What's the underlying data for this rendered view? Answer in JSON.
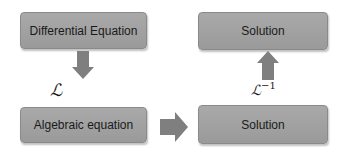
{
  "nodes": {
    "differential": {
      "label": "Differential Equation"
    },
    "solution_top": {
      "label": "Solution"
    },
    "algebraic": {
      "label": "Algebraic equation"
    },
    "solution_bottom": {
      "label": "Solution"
    }
  },
  "edges": {
    "laplace": {
      "symbol": "ℒ",
      "from": "Differential Equation",
      "to": "Algebraic equation"
    },
    "solve": {
      "from": "Algebraic equation",
      "to": "Solution"
    },
    "inverse_laplace": {
      "symbol": "ℒ",
      "exponent": "−1",
      "from": "Solution",
      "to": "Solution"
    }
  },
  "colors": {
    "box_fill": "#a3a3a3",
    "arrow_fill": "#7f7f7f",
    "text": "#1a1a1a"
  }
}
